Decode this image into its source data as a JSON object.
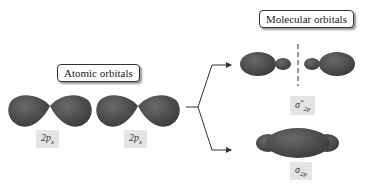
{
  "title_atomic": "Atomic orbitals",
  "title_molecular": "Molecular orbitals",
  "atomic": [
    {
      "label_main": "2p",
      "label_sub": "x"
    },
    {
      "label_main": "2p",
      "label_sub": "x"
    }
  ],
  "molecular": {
    "antibonding": {
      "symbol": "σ",
      "sup": "*",
      "sub": "2p"
    },
    "bonding": {
      "symbol": "σ",
      "sub": "2p"
    }
  },
  "colors": {
    "orbital_fill": "#505050",
    "orbital_dark": "#333333",
    "label_bg": "#e4e4e4",
    "arrow": "#333333"
  }
}
